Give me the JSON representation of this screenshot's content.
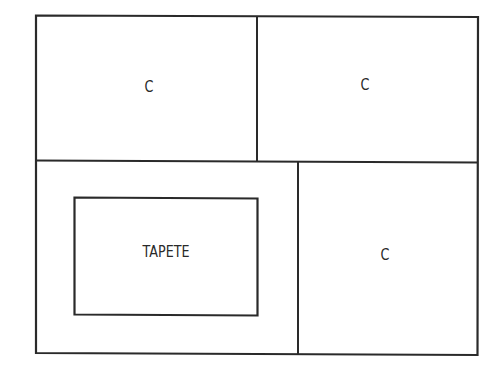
{
  "diagram": {
    "type": "floor-plan-layout",
    "line_color": "#2a2a2a",
    "background": "#ffffff",
    "outer_frame": {
      "x1": 36,
      "y1": 16,
      "x2": 478,
      "y2": 354
    },
    "regions": [
      {
        "id": "top-left",
        "label": "C",
        "label_pos": [
          149,
          86
        ]
      },
      {
        "id": "top-right",
        "label": "C",
        "label_pos": [
          365,
          84
        ]
      },
      {
        "id": "bottom-left",
        "label": "",
        "label_pos": null
      },
      {
        "id": "bottom-right",
        "label": "C",
        "label_pos": [
          385,
          254
        ]
      }
    ],
    "inner_box": {
      "label": "TAPETE",
      "x1": 74,
      "y1": 198,
      "x2": 258,
      "y2": 315,
      "label_pos": [
        166,
        252
      ]
    },
    "labels": {
      "top_left": "C",
      "top_right": "C",
      "bottom_right": "C",
      "inner": "TAPETE"
    }
  }
}
